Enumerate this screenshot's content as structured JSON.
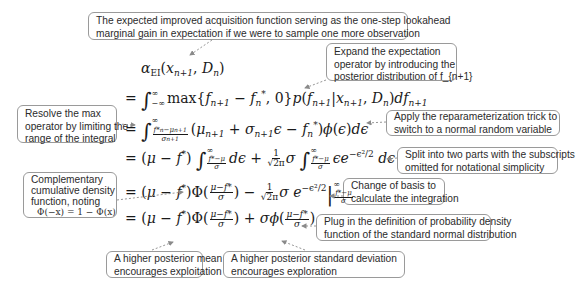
{
  "title_note": "The expected improved acquisition function serving as the one-step lookahead marginal gain in expectation if we were to sample one more observation",
  "notes": {
    "top": [
      "The expected improved acquisition function serving as the one-step lookahead",
      "marginal gain in expectation if we were to sample one more observation"
    ],
    "expand": [
      "Expand the expectation",
      "operator by introducing the",
      "posterior distribution of f_{n+1}"
    ],
    "resolve": [
      "Resolve the max",
      "operator by limiting the",
      "range of the integral"
    ],
    "apply": [
      "Apply the reparameterization trick to",
      "switch to a normal random variable"
    ],
    "split": [
      "Split into two parts with the subscripts",
      "omitted for notational simplicity"
    ],
    "complementary": [
      "Complementary",
      "cumulative density",
      "function, noting",
      "Φ(−x) = 1 − Φ(x)"
    ],
    "change": [
      "Change of basis to",
      "calculate the integration"
    ],
    "plug": [
      "Plug in the definition of probability density",
      "function of the standard normal distribution"
    ],
    "mean": [
      "A higher posterior mean",
      "encourages exploitation"
    ],
    "std": [
      "A higher posterior standard deviation",
      "encourages exploration"
    ]
  },
  "equations": {
    "line0": "α_EI(x_{n+1}, D_n)",
    "line1": "= ∫_{-∞}^{∞} max{f_{n+1} − f*_n, 0} p(f_{n+1} | x_{n+1}, D_n) df_{n+1}",
    "line2": "= ∫_{(f*_n − μ_{n+1})/σ_{n+1}}^{∞} (μ_{n+1} + σ_{n+1}ε − f*_n) φ(ε) dε",
    "line3": "= (μ − f*) ∫_{(f*−μ)/σ}^{∞} dε + (1/√(2π)) σ ∫_{(f*−μ)/σ}^{∞} ε e^{−ε²/2} dε",
    "line4": "= (μ − f*) Φ((μ−f*)/σ) − (1/√(2π)) σ e^{−ε²/2} |_{(f*−μ)/σ}^{∞}",
    "line5": "= (μ − f*) Φ((μ−f*)/σ) + σ φ((μ−f*)/σ)"
  },
  "colors": {
    "box_border": "#9a9a9a",
    "arrow": "#8a8a8a",
    "text": "#2b2b2b"
  }
}
